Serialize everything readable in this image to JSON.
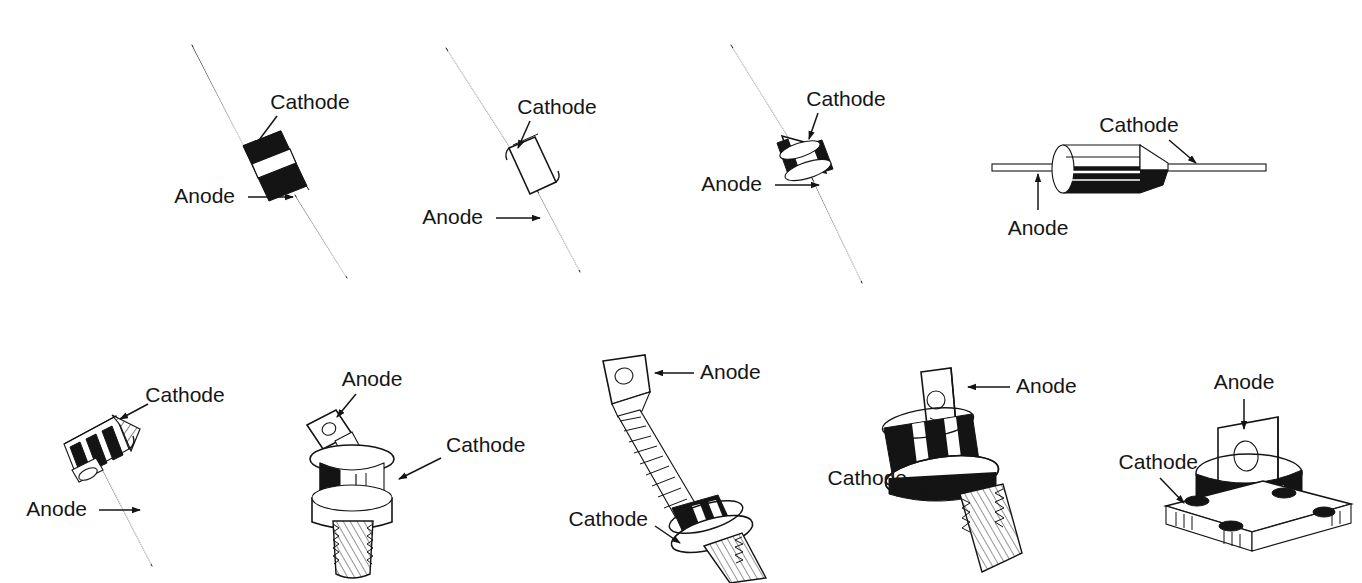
{
  "figure": {
    "background_color": "#ffffff",
    "ink_color": "#141414",
    "width": 1362,
    "height": 583,
    "rows": 2,
    "columns_top": 4,
    "columns_bottom": 5
  },
  "terminals": {
    "anode": "Anode",
    "cathode": "Cathode"
  },
  "devices": [
    {
      "id": "axial-black-body-banded",
      "row": "top",
      "position": 1,
      "package": "axial-lead glass/plastic diode, black body with white cathode band",
      "orientation": "diagonal, leads upper-left to lower-right",
      "labels": [
        {
          "terminal": "Cathode",
          "text": "Cathode",
          "text_x": 310,
          "text_y": 103,
          "arrow_from_x": 277,
          "arrow_from_y": 116,
          "arrow_to_x": 251,
          "arrow_to_y": 152
        },
        {
          "terminal": "Anode",
          "text": "Anode",
          "text_x": 209,
          "text_y": 197,
          "arrow_from_x": 252,
          "arrow_from_y": 197,
          "arrow_to_x": 296,
          "arrow_to_y": 197
        }
      ]
    },
    {
      "id": "axial-white-body",
      "row": "top",
      "position": 2,
      "package": "axial-lead diode, light/clear body with rounded ends",
      "orientation": "diagonal, leads upper-left to lower-right",
      "labels": [
        {
          "terminal": "Cathode",
          "text": "Cathode",
          "text_x": 557,
          "text_y": 108,
          "arrow_from_x": 528,
          "arrow_from_y": 121,
          "arrow_to_x": 516,
          "arrow_to_y": 152
        },
        {
          "terminal": "Anode",
          "text": "Anode",
          "text_x": 457,
          "text_y": 218,
          "arrow_from_x": 500,
          "arrow_from_y": 218,
          "arrow_to_x": 543,
          "arrow_to_y": 218
        }
      ]
    },
    {
      "id": "axial-drum-body",
      "row": "top",
      "position": 3,
      "package": "axial-lead diode, short barrel/drum body with dark end rings",
      "orientation": "diagonal, leads upper-left to lower-right",
      "labels": [
        {
          "terminal": "Cathode",
          "text": "Cathode",
          "text_x": 846,
          "text_y": 100,
          "arrow_from_x": 818,
          "arrow_from_y": 113,
          "arrow_to_x": 807,
          "arrow_to_y": 143
        },
        {
          "terminal": "Anode",
          "text": "Anode",
          "text_x": 736,
          "text_y": 185,
          "arrow_from_x": 779,
          "arrow_from_y": 185,
          "arrow_to_x": 822,
          "arrow_to_y": 185
        }
      ]
    },
    {
      "id": "axial-cylinder-horizontal",
      "row": "top",
      "position": 4,
      "package": "axial-lead power rectifier, cylindrical body with tapered cathode end",
      "orientation": "horizontal",
      "labels": [
        {
          "terminal": "Cathode",
          "text": "Cathode",
          "text_x": 1139,
          "text_y": 126,
          "arrow_from_x": 1169,
          "arrow_from_y": 140,
          "arrow_to_x": 1192,
          "arrow_to_y": 168
        },
        {
          "terminal": "Anode",
          "text": "Anode",
          "text_x": 1038,
          "text_y": 229,
          "arrow_from_x": 1038,
          "arrow_from_y": 206,
          "arrow_to_x": 1038,
          "arrow_to_y": 177
        }
      ]
    },
    {
      "id": "finned-heatsink-diode",
      "row": "bottom",
      "position": 1,
      "package": "finned heat-sink diode on single wire lead",
      "orientation": "diagonal, lead to lower-right",
      "labels": [
        {
          "terminal": "Cathode",
          "text": "Cathode",
          "text_x": 185,
          "text_y": 396,
          "arrow_from_x": 150,
          "arrow_from_y": 404,
          "arrow_to_x": 117,
          "arrow_to_y": 420
        },
        {
          "terminal": "Anode",
          "text": "Anode",
          "text_x": 61,
          "text_y": 510,
          "arrow_from_x": 102,
          "arrow_from_y": 510,
          "arrow_to_x": 143,
          "arrow_to_y": 510
        }
      ]
    },
    {
      "id": "stud-mount-flag-lead",
      "row": "bottom",
      "position": 2,
      "package": "stud-mount rectifier with flat flag terminal, threaded cathode stud",
      "orientation": "upright, stud down",
      "labels": [
        {
          "terminal": "Anode",
          "text": "Anode",
          "text_x": 372,
          "text_y": 380,
          "arrow_from_x": 356,
          "arrow_from_y": 394,
          "arrow_to_x": 335,
          "arrow_to_y": 420
        },
        {
          "terminal": "Cathode",
          "text": "Cathode",
          "text_x": 446,
          "text_y": 446,
          "arrow_from_x": 438,
          "arrow_from_y": 460,
          "arrow_to_x": 396,
          "arrow_to_y": 480
        }
      ]
    },
    {
      "id": "stud-mount-braided-lead",
      "row": "bottom",
      "position": 3,
      "package": "stud-mount rectifier with braided flexible anode lead and terminal lug",
      "orientation": "diagonal, stud at lower-right",
      "labels": [
        {
          "terminal": "Anode",
          "text": "Anode",
          "text_x": 700,
          "text_y": 373,
          "arrow_from_x": 676,
          "arrow_from_y": 373,
          "arrow_to_x": 639,
          "arrow_to_y": 373
        },
        {
          "terminal": "Cathode",
          "text": "Cathode",
          "text_x": 605,
          "text_y": 520,
          "arrow_from_x": 652,
          "arrow_from_y": 526,
          "arrow_to_x": 677,
          "arrow_to_y": 541
        }
      ]
    },
    {
      "id": "stud-mount-tab-lead",
      "row": "bottom",
      "position": 4,
      "package": "stud-mount rectifier with upright tab terminal, black body, threaded stud",
      "orientation": "upright, tilted stud down-right",
      "labels": [
        {
          "terminal": "Anode",
          "text": "Anode",
          "text_x": 1016,
          "text_y": 387,
          "arrow_from_x": 991,
          "arrow_from_y": 387,
          "arrow_to_x": 952,
          "arrow_to_y": 387
        },
        {
          "terminal": "Cathode",
          "text": "Cathode",
          "text_x": 864,
          "text_y": 479,
          "arrow_from_x": 906,
          "arrow_from_y": 483,
          "arrow_to_x": 932,
          "arrow_to_y": 495
        }
      ]
    },
    {
      "id": "flat-base-press-pak",
      "row": "bottom",
      "position": 5,
      "package": "flat-base press-pak / disc rectifier on four-hole mounting flange",
      "orientation": "upright on square base",
      "labels": [
        {
          "terminal": "Anode",
          "text": "Anode",
          "text_x": 1244,
          "text_y": 383,
          "arrow_from_x": 1244,
          "arrow_from_y": 399,
          "arrow_to_x": 1244,
          "arrow_to_y": 425
        },
        {
          "terminal": "Cathode",
          "text": "Cathode",
          "text_x": 1141,
          "text_y": 463,
          "arrow_from_x": 1160,
          "arrow_from_y": 478,
          "arrow_to_x": 1180,
          "arrow_to_y": 500
        }
      ]
    }
  ]
}
